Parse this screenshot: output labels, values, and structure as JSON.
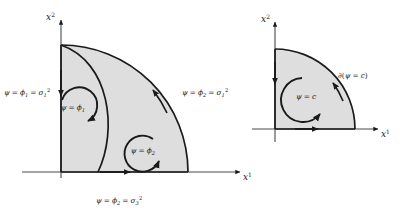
{
  "figure": {
    "background_color": "#ffffff",
    "stroke_color": "#1a1a1a",
    "fill_color": "#dedede",
    "axis_color": "#4a4a4a"
  },
  "left_diagram": {
    "name": "level-set-decomposition-diagram",
    "axes": {
      "x_label": "x",
      "x_superscript": "1",
      "y_label": "x",
      "y_superscript": "2"
    },
    "boundary_labels": [
      {
        "id": "left-edge-label",
        "psi": "ψ",
        "eq1": "=",
        "phi": "ϕ",
        "phi_sub": "1",
        "eq2": "=",
        "sigma": "σ",
        "sigma_sub": "1",
        "sigma_sup": "2",
        "full_text": "ψ = ϕ₁ = σ₁²"
      },
      {
        "id": "outer-arc-label",
        "psi": "ψ",
        "eq1": "=",
        "phi": "ϕ",
        "phi_sub": "2",
        "eq2": "=",
        "sigma": "σ",
        "sigma_sub": "1",
        "sigma_sup": "2",
        "full_text": "ψ = ϕ₂ = σ₁²"
      },
      {
        "id": "bottom-edge-label",
        "psi": "ψ",
        "eq1": "=",
        "phi": "ϕ",
        "phi_sub": "2",
        "eq2": "=",
        "sigma": "σ",
        "sigma_sub": "3",
        "sigma_sup": "2",
        "full_text": "ψ = ϕ₂ = σ₃²"
      }
    ],
    "region_labels": [
      {
        "id": "region-phi-1",
        "psi": "ψ",
        "eq": "=",
        "phi": "ϕ",
        "phi_sub": "1",
        "full_text": "ψ = ϕ₁"
      },
      {
        "id": "region-phi-2",
        "psi": "ψ",
        "eq": "=",
        "phi": "ϕ",
        "phi_sub": "2",
        "full_text": "ψ = ϕ₂"
      }
    ]
  },
  "right_diagram": {
    "name": "level-set-boundary-diagram",
    "axes": {
      "x_label": "x",
      "x_superscript": "1",
      "y_label": "x",
      "y_superscript": "2"
    },
    "boundary_label": {
      "id": "boundary-operator-label",
      "partial": "∂",
      "open": "(",
      "psi": "ψ",
      "eq": "=",
      "c": "c",
      "close": ")",
      "full_text": "∂(ψ = c)"
    },
    "region_label": {
      "id": "region-c",
      "psi": "ψ",
      "eq": "=",
      "c": "c",
      "full_text": "ψ = c"
    }
  }
}
